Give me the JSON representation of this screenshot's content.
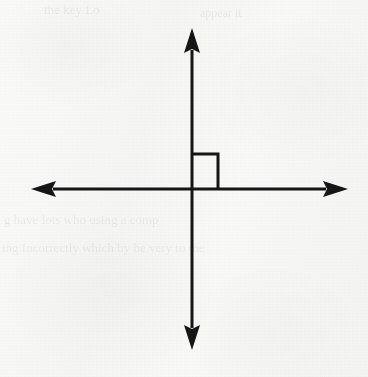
{
  "page": {
    "width": 368,
    "height": 377,
    "background_color": "#f7f7f6",
    "ink_color": "#161616"
  },
  "figure": {
    "name": "perpendicular-lines-diagram",
    "origin": {
      "x": 192,
      "y": 189
    },
    "stroke_width": 3,
    "horizontal_axis": {
      "name": "horizontal-line",
      "x_start": 31,
      "x_end": 348,
      "y": 189,
      "arrow_left": true,
      "arrow_right": true
    },
    "vertical_axis": {
      "name": "vertical-line",
      "y_start": 28,
      "y_end": 350,
      "x": 192,
      "arrow_up": true,
      "arrow_down": true
    },
    "right_angle_marker": {
      "name": "right-angle-square",
      "x": 192,
      "y": 154,
      "size_x": 26,
      "size_y": 35,
      "quadrant": "upper-right",
      "stroke_width": 3
    },
    "arrowhead": {
      "width": 14,
      "length": 24
    }
  },
  "bleed_through": [
    {
      "text": "the key Lo",
      "x": 44,
      "y": 2,
      "size": 13,
      "opacity": 0.05
    },
    {
      "text": "appear it",
      "x": 200,
      "y": 6,
      "size": 12,
      "opacity": 0.04
    },
    {
      "text": "g have lots who using a comp",
      "x": 4,
      "y": 212,
      "size": 13,
      "opacity": 0.055
    },
    {
      "text": "ing Incorrectly which by be very to the",
      "x": 2,
      "y": 240,
      "size": 13,
      "opacity": 0.055
    }
  ]
}
